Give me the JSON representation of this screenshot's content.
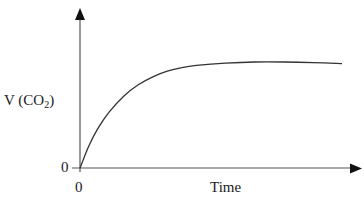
{
  "chart_data": {
    "type": "line",
    "title": "",
    "xlabel": "Time",
    "ylabel": "V (CO2)",
    "ylabel_parts": {
      "prefix": "V (CO",
      "subscript": "2",
      "suffix": ")"
    },
    "x_tick_labels": [
      "0"
    ],
    "y_tick_labels": [
      "0"
    ],
    "grid": false,
    "legend": null,
    "axis_ranges": {
      "x": [
        0,
        10
      ],
      "y": [
        0,
        10
      ]
    },
    "series": [
      {
        "name": "V (CO2) vs Time",
        "description": "Qualitative curve: rises steeply from origin then levels off to a plateau (slight decline at the end)",
        "x": [
          0,
          0.3,
          0.6,
          1.0,
          1.5,
          2.0,
          2.5,
          3.0,
          3.5,
          4.0,
          5.0,
          6.0,
          7.0,
          8.0,
          9.0
        ],
        "y": [
          0,
          1.9,
          3.4,
          4.9,
          6.3,
          7.3,
          8.0,
          8.5,
          8.8,
          9.0,
          9.2,
          9.3,
          9.3,
          9.25,
          9.15
        ]
      }
    ]
  }
}
